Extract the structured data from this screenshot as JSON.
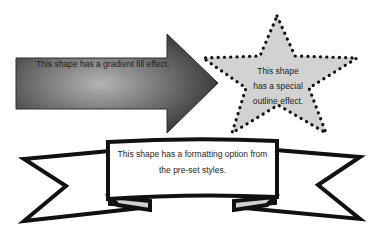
{
  "shapes": {
    "arrow": {
      "label": "This shape has a gradient fill effect.",
      "fill_dark": "#3a3a3a",
      "fill_light": "#b4b4b4"
    },
    "star": {
      "label_lines": [
        "This shape",
        "has a special",
        "outline effect."
      ],
      "fill": "#d2d2d2",
      "outline": "#111111",
      "outline_style": "dotted"
    },
    "ribbon": {
      "label_lines": [
        "This shape has a formatting option from",
        "the pre-set styles."
      ],
      "fill": "#ffffff",
      "outline": "#111111"
    }
  }
}
